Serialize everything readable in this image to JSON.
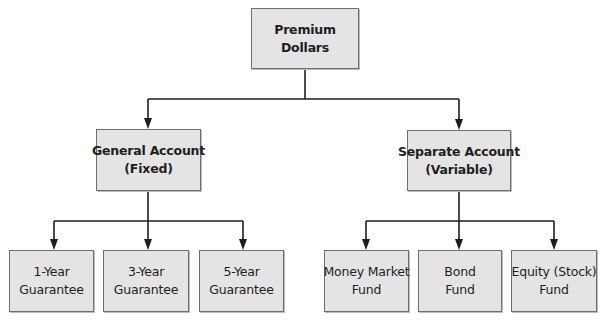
{
  "diagram": {
    "type": "hierarchy",
    "colors": {
      "box_fill": "#e4e4e4",
      "box_border": "#6e6e6e",
      "line": "#1e1e1e",
      "text": "#1e1e1e"
    },
    "root": {
      "line1": "Premium",
      "line2": "Dollars"
    },
    "branches": [
      {
        "line1": "General Account",
        "line2": "(Fixed)",
        "children": [
          {
            "line1": "1-Year",
            "line2": "Guarantee"
          },
          {
            "line1": "3-Year",
            "line2": "Guarantee"
          },
          {
            "line1": "5-Year",
            "line2": "Guarantee"
          }
        ]
      },
      {
        "line1": "Separate Account",
        "line2": "(Variable)",
        "children": [
          {
            "line1": "Money Market",
            "line2": "Fund"
          },
          {
            "line1": "Bond",
            "line2": "Fund"
          },
          {
            "line1": "Equity (Stock)",
            "line2": "Fund"
          }
        ]
      }
    ]
  }
}
